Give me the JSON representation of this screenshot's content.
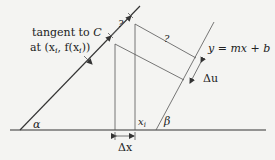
{
  "diagram": {
    "tangent_label_line1": "tangent to ",
    "tangent_label_C": "C",
    "tangent_label_line2": "at (x",
    "tangent_label_sub_i": "i",
    "tangent_label_mid": ", f(x",
    "tangent_label_sub_i2": "i",
    "tangent_label_end": "))",
    "question_mark_1": "?",
    "question_mark_2": "?",
    "line_equation": "y = mx + b",
    "delta_u": "Δu",
    "delta_x": "Δx",
    "x_i_label": "x",
    "x_i_sub": "i",
    "alpha": "α",
    "beta": "β"
  },
  "colors": {
    "background": "#f4f4f2",
    "stroke": "#333333"
  }
}
